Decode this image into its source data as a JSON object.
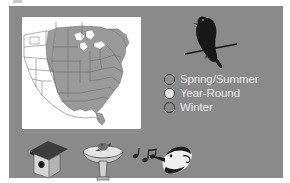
{
  "panel": {
    "background_color": "#8a8a8a",
    "margin_color": "#ffffff"
  },
  "map": {
    "name": "united-states-range-map",
    "background_color": "#ffffff",
    "range_shading_color": "#9a9a9a",
    "outline_color": "#6d6d6d",
    "description": "Range map of the eastern United States with shaded distribution area"
  },
  "bird_silhouette": {
    "name": "perched-bird-silhouette",
    "color": "#181818",
    "description": "Dark silhouette of a bird perched on a branch"
  },
  "legend": {
    "title": "",
    "items": [
      {
        "label": "Spring/Summer",
        "swatch_fill": "#8f8f8f",
        "swatch_outline": "#3a3a3a",
        "icon_name": "legend-swatch-spring-summer"
      },
      {
        "label": "Year-Round",
        "swatch_fill": "#e2e2e2",
        "swatch_outline": "#3a3a3a",
        "icon_name": "legend-swatch-year-round"
      },
      {
        "label": "Winter",
        "swatch_fill": "#8a8a8a",
        "swatch_outline": "#2f2f2f",
        "icon_name": "legend-swatch-winter"
      }
    ],
    "text_color": "#eaeaea"
  },
  "icons": [
    {
      "name": "birdhouse-icon",
      "label": "Birdhouse",
      "roof_color": "#3c3c3c",
      "body_color": "#d6d6d6",
      "hole_color": "#1a1a1a"
    },
    {
      "name": "birdbath-icon",
      "label": "Birdbath",
      "basin_color": "#e4e4e4",
      "outline_color": "#4a4a4a"
    },
    {
      "name": "bird-song-icon",
      "label": "Bird Song",
      "note_color": "#2a2a2a",
      "head_color": "#f0f0f0",
      "accent_color": "#1c1c1c"
    }
  ]
}
